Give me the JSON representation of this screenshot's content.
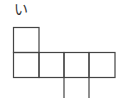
{
  "diagram": {
    "type": "cube-net",
    "label": "い",
    "line_color": "#444444",
    "cells": [
      {
        "row": 0,
        "col": 0
      },
      {
        "row": 1,
        "col": 0
      },
      {
        "row": 1,
        "col": 1
      },
      {
        "row": 1,
        "col": 2
      },
      {
        "row": 1,
        "col": 3
      }
    ],
    "open_extensions": [
      {
        "x": 64,
        "from_y": 77,
        "to_y": 98
      },
      {
        "x": 89,
        "from_y": 77,
        "to_y": 98
      }
    ]
  }
}
